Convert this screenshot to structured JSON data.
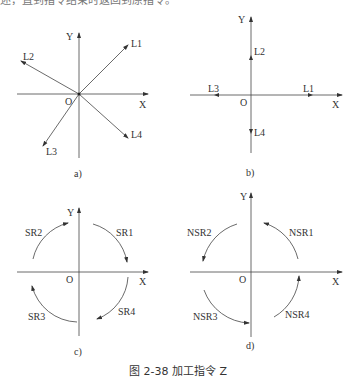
{
  "top_text": "述，直到指令结束时返回到原指令。",
  "caption": "图 2-38   加工指令 Z",
  "panels": {
    "a": {
      "label": "a)",
      "axis_x": "X",
      "axis_y": "Y",
      "origin": "O",
      "lines": [
        "L1",
        "L2",
        "L3",
        "L4"
      ]
    },
    "b": {
      "label": "b)",
      "axis_x": "X",
      "axis_y": "Y",
      "origin": "O",
      "lines": [
        "L1",
        "L2",
        "L3",
        "L4"
      ]
    },
    "c": {
      "label": "c)",
      "axis_x": "X",
      "axis_y": "Y",
      "origin": "O",
      "arcs": [
        "SR1",
        "SR2",
        "SR3",
        "SR4"
      ]
    },
    "d": {
      "label": "d)",
      "axis_x": "X",
      "axis_y": "Y",
      "origin": "O",
      "arcs": [
        "NSR1",
        "NSR2",
        "NSR3",
        "NSR4"
      ]
    }
  }
}
